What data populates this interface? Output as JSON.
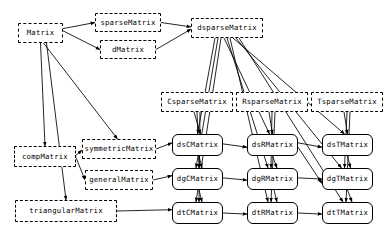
{
  "diagram": {
    "canvas": {
      "width": 389,
      "height": 237
    },
    "style": {
      "virtual_border": "dashed",
      "concrete_border": "solid",
      "line_color": "#000000",
      "background": "#ffffff"
    },
    "nodes": [
      {
        "id": "Matrix",
        "label": "Matrix",
        "kind": "virtual",
        "x": 18,
        "y": 23,
        "w": 45,
        "h": 20
      },
      {
        "id": "sparseMatrix",
        "label": "sparseMatrix",
        "kind": "virtual",
        "x": 95,
        "y": 13,
        "w": 66,
        "h": 19
      },
      {
        "id": "dMatrix",
        "label": "dMatrix",
        "kind": "virtual",
        "x": 100,
        "y": 40,
        "w": 56,
        "h": 19
      },
      {
        "id": "dsparseMatrix",
        "label": "dsparseMatrix",
        "kind": "virtual",
        "x": 191,
        "y": 18,
        "w": 72,
        "h": 20
      },
      {
        "id": "CsparseMatrix",
        "label": "CsparseMatrix",
        "kind": "virtual",
        "x": 161,
        "y": 92,
        "w": 72,
        "h": 20
      },
      {
        "id": "RsparseMatrix",
        "label": "RsparseMatrix",
        "kind": "virtual",
        "x": 236,
        "y": 92,
        "w": 72,
        "h": 20
      },
      {
        "id": "TsparseMatrix",
        "label": "TsparseMatrix",
        "kind": "virtual",
        "x": 311,
        "y": 92,
        "w": 72,
        "h": 20
      },
      {
        "id": "compMatrix",
        "label": "compMatrix",
        "kind": "virtual",
        "x": 14,
        "y": 146,
        "w": 62,
        "h": 21
      },
      {
        "id": "symmetricMatrix",
        "label": "symmetricMatrix",
        "kind": "virtual",
        "x": 82,
        "y": 139,
        "w": 74,
        "h": 20
      },
      {
        "id": "generalMatrix",
        "label": "generalMatrix",
        "kind": "virtual",
        "x": 85,
        "y": 170,
        "w": 68,
        "h": 20
      },
      {
        "id": "triangularMatrix",
        "label": "triangularMatrix",
        "kind": "virtual",
        "x": 15,
        "y": 200,
        "w": 102,
        "h": 22
      },
      {
        "id": "dsCMatrix",
        "label": "dsCMatrix",
        "kind": "concrete",
        "x": 172,
        "y": 134,
        "w": 51,
        "h": 22
      },
      {
        "id": "dsRMatrix",
        "label": "dsRMatrix",
        "kind": "concrete",
        "x": 247,
        "y": 134,
        "w": 51,
        "h": 22
      },
      {
        "id": "dsTMatrix",
        "label": "dsTMatrix",
        "kind": "concrete",
        "x": 322,
        "y": 134,
        "w": 51,
        "h": 22
      },
      {
        "id": "dgCMatrix",
        "label": "dgCMatrix",
        "kind": "concrete",
        "x": 172,
        "y": 168,
        "w": 51,
        "h": 22
      },
      {
        "id": "dgRMatrix",
        "label": "dgRMatrix",
        "kind": "concrete",
        "x": 247,
        "y": 168,
        "w": 51,
        "h": 22
      },
      {
        "id": "dgTMatrix",
        "label": "dgTMatrix",
        "kind": "concrete",
        "x": 322,
        "y": 168,
        "w": 51,
        "h": 22
      },
      {
        "id": "dtCMatrix",
        "label": "dtCMatrix",
        "kind": "concrete",
        "x": 172,
        "y": 202,
        "w": 51,
        "h": 22
      },
      {
        "id": "dtRMatrix",
        "label": "dtRMatrix",
        "kind": "concrete",
        "x": 247,
        "y": 202,
        "w": 51,
        "h": 22
      },
      {
        "id": "dtTMatrix",
        "label": "dtTMatrix",
        "kind": "concrete",
        "x": 322,
        "y": 202,
        "w": 51,
        "h": 22
      }
    ],
    "edges": [
      {
        "from": "Matrix",
        "to": "sparseMatrix"
      },
      {
        "from": "Matrix",
        "to": "dMatrix"
      },
      {
        "from": "Matrix",
        "to": "compMatrix"
      },
      {
        "from": "Matrix",
        "to": "symmetricMatrix"
      },
      {
        "from": "Matrix",
        "to": "triangularMatrix"
      },
      {
        "from": "sparseMatrix",
        "to": "dsparseMatrix"
      },
      {
        "from": "dMatrix",
        "to": "dsparseMatrix"
      },
      {
        "from": "compMatrix",
        "to": "symmetricMatrix"
      },
      {
        "from": "compMatrix",
        "to": "generalMatrix"
      },
      {
        "from": "symmetricMatrix",
        "to": "dsCMatrix"
      },
      {
        "from": "generalMatrix",
        "to": "dgCMatrix"
      },
      {
        "from": "triangularMatrix",
        "to": "dtCMatrix"
      },
      {
        "from": "dsparseMatrix",
        "to": "dsCMatrix"
      },
      {
        "from": "dsparseMatrix",
        "to": "dgCMatrix"
      },
      {
        "from": "dsparseMatrix",
        "to": "dtCMatrix"
      },
      {
        "from": "dsparseMatrix",
        "to": "dsRMatrix"
      },
      {
        "from": "dsparseMatrix",
        "to": "dgRMatrix"
      },
      {
        "from": "dsparseMatrix",
        "to": "dtRMatrix"
      },
      {
        "from": "dsparseMatrix",
        "to": "dsTMatrix"
      },
      {
        "from": "dsparseMatrix",
        "to": "dgTMatrix"
      },
      {
        "from": "dsparseMatrix",
        "to": "dtTMatrix"
      },
      {
        "from": "CsparseMatrix",
        "to": "dsCMatrix"
      },
      {
        "from": "CsparseMatrix",
        "to": "dgCMatrix"
      },
      {
        "from": "CsparseMatrix",
        "to": "dtCMatrix"
      },
      {
        "from": "RsparseMatrix",
        "to": "dsRMatrix"
      },
      {
        "from": "RsparseMatrix",
        "to": "dgRMatrix"
      },
      {
        "from": "RsparseMatrix",
        "to": "dtRMatrix"
      },
      {
        "from": "TsparseMatrix",
        "to": "dsTMatrix"
      },
      {
        "from": "TsparseMatrix",
        "to": "dgTMatrix"
      },
      {
        "from": "TsparseMatrix",
        "to": "dtTMatrix"
      },
      {
        "from": "dsCMatrix",
        "to": "dsRMatrix"
      },
      {
        "from": "dsRMatrix",
        "to": "dsTMatrix"
      },
      {
        "from": "dgCMatrix",
        "to": "dgRMatrix"
      },
      {
        "from": "dgRMatrix",
        "to": "dgTMatrix"
      },
      {
        "from": "dtCMatrix",
        "to": "dtRMatrix"
      },
      {
        "from": "dtRMatrix",
        "to": "dtTMatrix"
      },
      {
        "from": "dsCMatrix",
        "to": "dgCMatrix"
      },
      {
        "from": "dgCMatrix",
        "to": "dtCMatrix"
      },
      {
        "from": "dsRMatrix",
        "to": "dgRMatrix"
      },
      {
        "from": "dgRMatrix",
        "to": "dtRMatrix"
      },
      {
        "from": "dsTMatrix",
        "to": "dgTMatrix"
      },
      {
        "from": "dgTMatrix",
        "to": "dtTMatrix"
      },
      {
        "from": "dsRMatrix",
        "to": "dgTMatrix"
      }
    ]
  }
}
